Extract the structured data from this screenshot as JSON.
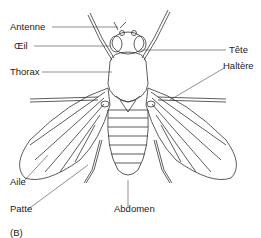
{
  "figure": {
    "panel_label": "(B)",
    "labels": {
      "antenne": "Antenne",
      "oeil": "Œil",
      "thorax": "Thorax",
      "tete": "Tête",
      "haltere": "Haltère",
      "aile": "Aile",
      "patte": "Patte",
      "abdomen": "Abdomen"
    },
    "colors": {
      "line": "#333333",
      "background": "#ffffff"
    }
  }
}
